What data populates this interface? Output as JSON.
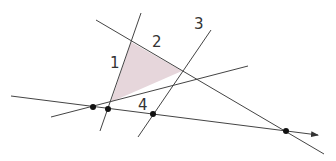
{
  "diagram": {
    "colors": {
      "line": "#444444",
      "fill": "#e6d6db",
      "point": "#111111"
    },
    "labels": [
      {
        "id": "1",
        "text": "1",
        "x": 110,
        "y": 68
      },
      {
        "id": "2",
        "text": "2",
        "x": 152,
        "y": 47
      },
      {
        "id": "3",
        "text": "3",
        "x": 194,
        "y": 29
      },
      {
        "id": "4",
        "text": "4",
        "x": 138,
        "y": 110
      }
    ],
    "lines": [
      {
        "id": "base-ray",
        "x1": 11,
        "y1": 96,
        "x2": 318,
        "y2": 135,
        "arrow": true
      },
      {
        "id": "line-1",
        "x1": 141,
        "y1": 13,
        "x2": 100,
        "y2": 131
      },
      {
        "id": "line-2",
        "x1": 96,
        "y1": 20,
        "x2": 324,
        "y2": 154
      },
      {
        "id": "line-3",
        "x1": 211,
        "y1": 30,
        "x2": 138,
        "y2": 137
      },
      {
        "id": "line-4",
        "x1": 51,
        "y1": 117,
        "x2": 248,
        "y2": 66
      }
    ],
    "triangle": {
      "points": "131,42 182,71 111,102"
    },
    "points": [
      {
        "id": "p1",
        "x": 93,
        "y": 107
      },
      {
        "id": "p2",
        "x": 108,
        "y": 109
      },
      {
        "id": "p3",
        "x": 153,
        "y": 114
      },
      {
        "id": "p4",
        "x": 286,
        "y": 131
      }
    ]
  }
}
